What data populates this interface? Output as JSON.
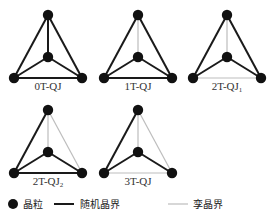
{
  "colors": {
    "random_boundary": "#1a1a1a",
    "twin_boundary": "#bdbdbd",
    "grain": "#111111"
  },
  "diagrams": [
    {
      "label": "0T-QJ",
      "sub": "",
      "twin_edges": []
    },
    {
      "label": "1T-QJ",
      "sub": "",
      "twin_edges": [
        "top-center"
      ]
    },
    {
      "label": "2T-QJ",
      "sub": "1",
      "twin_edges": [
        "top-center",
        "bl-br"
      ]
    },
    {
      "label": "2T-QJ",
      "sub": "2",
      "twin_edges": [
        "top-center",
        "top-br"
      ]
    },
    {
      "label": "3T-QJ",
      "sub": "",
      "twin_edges": [
        "top-center",
        "top-br",
        "bl-br"
      ]
    }
  ],
  "legend": {
    "grain": "晶粒",
    "random_boundary": "随机晶界",
    "twin_boundary": "孪晶界"
  }
}
